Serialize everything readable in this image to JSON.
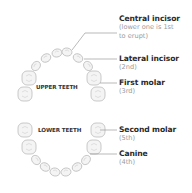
{
  "diagram": {
    "jaws": {
      "upper_label": "UPPER TEETH",
      "lower_label": "LOWER TEETH"
    },
    "labels": [
      {
        "id": "central-incisor",
        "title": "Central incisor",
        "note_lines": [
          "(lower one is 1st",
          "to erupt)"
        ]
      },
      {
        "id": "lateral-incisor",
        "title": "Lateral incisor",
        "note_lines": [
          "(2nd)"
        ]
      },
      {
        "id": "first-molar",
        "title": "First molar",
        "note_lines": [
          "(3rd)"
        ]
      },
      {
        "id": "second-molar",
        "title": "Second molar",
        "note_lines": [
          "(5th)"
        ]
      },
      {
        "id": "canine",
        "title": "Canine",
        "note_lines": [
          "(4th)"
        ]
      }
    ],
    "colors": {
      "title_text": "#2b2b2b",
      "note_text": "#9a9a9a",
      "leader_line": "#8c8c8c",
      "tooth_outline": "#bdbdbd",
      "tooth_fill": "#f4f4f4"
    }
  }
}
